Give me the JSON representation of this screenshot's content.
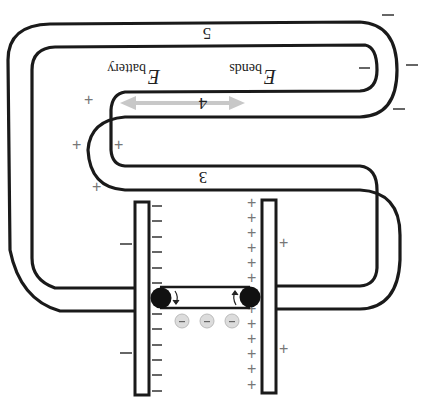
{
  "figure": {
    "orientation": "rotated-180",
    "colors": {
      "wire": "#1a1a1a",
      "charge_sign": "#777777",
      "field_arrow": "#c8c8c8",
      "roller": "#111111",
      "electron": "#d9d9d9"
    }
  },
  "labels": {
    "section_3": "3",
    "section_4": "4",
    "section_5": "5",
    "e_battery_main": "E",
    "e_battery_sub": "battery",
    "e_bends_main": "E",
    "e_bends_sub": "bends"
  },
  "charges": {
    "plus": "+",
    "minus": "−",
    "left_plate_minus_count": 13,
    "right_plate_plus_count": 13,
    "electron_count": 3,
    "electron_sign": "−"
  }
}
